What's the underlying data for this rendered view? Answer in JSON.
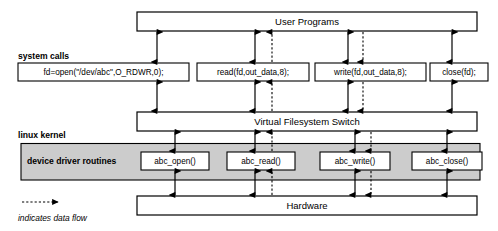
{
  "diagram": {
    "colors": {
      "background": "#ffffff",
      "stroke": "#000000",
      "band_fill": "#cccccc",
      "box_fill": "#ffffff"
    },
    "bars": [
      {
        "id": "user-programs",
        "label": "User Programs"
      },
      {
        "id": "vfs",
        "label": "Virtual Filesystem Switch"
      },
      {
        "id": "hardware",
        "label": "Hardware"
      }
    ],
    "side_labels": [
      {
        "id": "system-calls",
        "label": "system calls"
      },
      {
        "id": "linux-kernel",
        "label": "linux kernel"
      },
      {
        "id": "device-driver-routines",
        "label": "device driver routines"
      }
    ],
    "syscall_boxes": [
      {
        "id": "open",
        "label": "fd=open(\"/dev/abc\",O_RDWR,0);"
      },
      {
        "id": "read",
        "label": "read(fd,out_data,8);"
      },
      {
        "id": "write",
        "label": "write(fd,out_data,8);"
      },
      {
        "id": "close",
        "label": "close(fd);"
      }
    ],
    "driver_boxes": [
      {
        "id": "abc-open",
        "label": "abc_open()"
      },
      {
        "id": "abc-read",
        "label": "abc_read()"
      },
      {
        "id": "abc-write",
        "label": "abc_write()"
      },
      {
        "id": "abc-close",
        "label": "abc_close()"
      }
    ],
    "legend": {
      "icon": "dashed-arrow-icon",
      "label": "indicates data flow"
    }
  }
}
